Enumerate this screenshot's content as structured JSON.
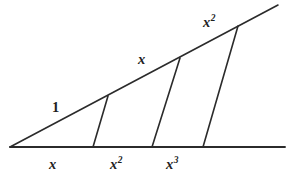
{
  "figure": {
    "background_color": "#ffffff",
    "stroke_color": "#2b2b2b",
    "labels": {
      "hypotenuse_segment_1": "1",
      "hypotenuse_segment_2_base": "x",
      "hypotenuse_segment_2_exponent": "",
      "hypotenuse_segment_3_base": "x",
      "hypotenuse_segment_3_exponent": "2",
      "base_segment_1_base": "x",
      "base_segment_1_exponent": "",
      "base_segment_2_base": "x",
      "base_segment_2_exponent": "2",
      "base_segment_3_base": "x",
      "base_segment_3_exponent": "3"
    },
    "geometry": {
      "apex": [
        10,
        147
      ],
      "baseline_start": [
        10,
        147
      ],
      "baseline_end": [
        285,
        147
      ],
      "hypotenuse_start": [
        10,
        147
      ],
      "hypotenuse_end": [
        278,
        5
      ],
      "transversals": [
        {
          "name": "transversal-1",
          "top": [
            108,
            96
          ],
          "bottom": [
            93,
            147
          ]
        },
        {
          "name": "transversal-2",
          "top": [
            180,
            58
          ],
          "bottom": [
            152,
            147
          ]
        },
        {
          "name": "transversal-3",
          "top": [
            238,
            26
          ],
          "bottom": [
            203,
            147
          ]
        }
      ]
    }
  }
}
